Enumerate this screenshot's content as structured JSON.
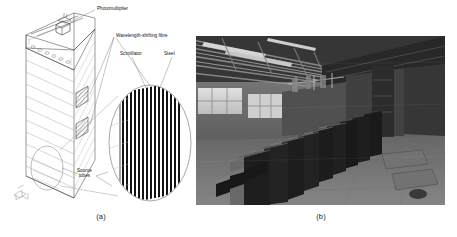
{
  "figure": {
    "panels": [
      {
        "id": "a",
        "caption": "(a)",
        "kind": "line-drawing",
        "description": "Isometric line drawing of a layered sampling-calorimeter module with a magnified elliptical inset",
        "labels": [
          {
            "key": "photomultiplier",
            "text": "Photomultiplier"
          },
          {
            "key": "wls_fibre",
            "text": "Wavelength-shifting fibre"
          },
          {
            "key": "scintillator",
            "text": "Scintillator"
          },
          {
            "key": "steel",
            "text": "Steel"
          },
          {
            "key": "source_tubes_line1",
            "text": "Source"
          },
          {
            "key": "source_tubes_line2",
            "text": "tubes"
          }
        ]
      },
      {
        "id": "b",
        "caption": "(b)",
        "kind": "photograph",
        "description": "Grayscale photograph of assembled detector modules standing in a large industrial assembly hall"
      }
    ]
  },
  "colors": {
    "background": "#ffffff",
    "line": "#3b3b3b",
    "line_light": "#8d8d8d",
    "text": "#1a1a1a",
    "steel_plate": "#111111",
    "scintillator_plate": "#ffffff",
    "photo_dark": "#2a2a2a",
    "photo_mid": "#7b7b7b",
    "photo_light": "#d8d8d8"
  }
}
